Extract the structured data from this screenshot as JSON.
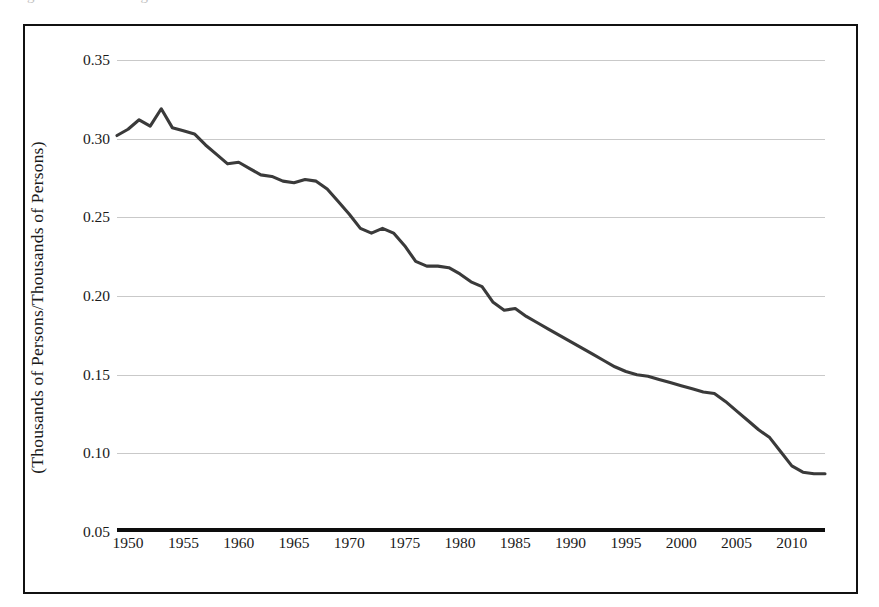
{
  "figure": {
    "caption_remnant": "Figure 3. Ratio of Agricultural Workers to Total Workers",
    "frame_border_color": "#111111",
    "line_color": "#3a3a3a",
    "gridline_color": "#c9c9c9",
    "axis_color": "#0d0d0d"
  },
  "axes": {
    "y_title": "(Thousands of Persons/Thousands of Persons)",
    "x_title": "",
    "y_ticks": [
      "0.35",
      "0.30",
      "0.25",
      "0.20",
      "0.15",
      "0.10",
      "0.05"
    ],
    "x_ticks": [
      "1950",
      "1955",
      "1960",
      "1965",
      "1970",
      "1975",
      "1980",
      "1985",
      "1990",
      "1995",
      "2000",
      "2005",
      "2010"
    ]
  },
  "chart_data": {
    "type": "line",
    "title": "",
    "subtitle": "",
    "xlabel": "",
    "ylabel": "(Thousands of Persons/Thousands of Persons)",
    "xlim": [
      1949,
      2013
    ],
    "ylim": [
      0.05,
      0.35
    ],
    "yticks": [
      0.05,
      0.1,
      0.15,
      0.2,
      0.25,
      0.3,
      0.35
    ],
    "xticks": [
      1950,
      1955,
      1960,
      1965,
      1970,
      1975,
      1980,
      1985,
      1990,
      1995,
      2000,
      2005,
      2010
    ],
    "grid": "horizontal",
    "legend": "none",
    "annotations": [],
    "series": [
      {
        "name": "Ratio",
        "x": [
          1949,
          1950,
          1951,
          1952,
          1953,
          1954,
          1955,
          1956,
          1957,
          1958,
          1959,
          1960,
          1961,
          1962,
          1963,
          1964,
          1965,
          1966,
          1967,
          1968,
          1969,
          1970,
          1971,
          1972,
          1973,
          1974,
          1975,
          1976,
          1977,
          1978,
          1979,
          1980,
          1981,
          1982,
          1983,
          1984,
          1985,
          1986,
          1987,
          1988,
          1989,
          1990,
          1991,
          1992,
          1993,
          1994,
          1995,
          1996,
          1997,
          1998,
          1999,
          2000,
          2001,
          2002,
          2003,
          2004,
          2005,
          2006,
          2007,
          2008,
          2009,
          2010,
          2011,
          2012,
          2013
        ],
        "y": [
          0.302,
          0.306,
          0.312,
          0.308,
          0.319,
          0.307,
          0.305,
          0.303,
          0.296,
          0.29,
          0.284,
          0.285,
          0.281,
          0.277,
          0.276,
          0.273,
          0.272,
          0.274,
          0.273,
          0.268,
          0.26,
          0.252,
          0.243,
          0.24,
          0.243,
          0.24,
          0.232,
          0.222,
          0.219,
          0.219,
          0.218,
          0.214,
          0.209,
          0.206,
          0.196,
          0.191,
          0.192,
          0.187,
          0.183,
          0.179,
          0.175,
          0.171,
          0.167,
          0.163,
          0.159,
          0.155,
          0.152,
          0.15,
          0.149,
          0.147,
          0.145,
          0.143,
          0.141,
          0.139,
          0.138,
          0.133,
          0.127,
          0.121,
          0.115,
          0.11,
          0.101,
          0.092,
          0.088,
          0.087,
          0.087
        ]
      }
    ]
  }
}
